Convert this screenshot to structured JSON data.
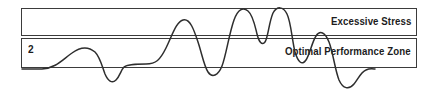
{
  "diagram": {
    "background_color": "#ffffff",
    "border_color": "#3b3b3b",
    "wave_color": "#2e2e2e",
    "text_color": "#1c1c1c"
  },
  "zones": {
    "excessive": {
      "label": "Excessive Stress",
      "top": 8,
      "height": 28
    },
    "optimal": {
      "label": "Optimal Performance Zone",
      "top": 38,
      "height": 30
    }
  },
  "index_marker": {
    "value": "2"
  },
  "chart_data": {
    "type": "line",
    "xlabel": "",
    "ylabel": "",
    "grid": false,
    "legend": null,
    "xlim": [
      21,
      417
    ],
    "ylim": [
      98,
      0
    ],
    "annotations": [
      {
        "text": "Excessive Stress",
        "zone": "excessive",
        "position": "right"
      },
      {
        "text": "Optimal Performance Zone",
        "zone": "optimal",
        "position": "right"
      },
      {
        "text": "2",
        "zone": "optimal",
        "position": "left"
      }
    ],
    "bands": [
      {
        "name": "Excessive Stress",
        "y_top": 8,
        "y_bottom": 36
      },
      {
        "name": "Optimal Performance Zone",
        "y_top": 38,
        "y_bottom": 68
      }
    ],
    "series": [
      {
        "name": "stress-trace",
        "path": "M 22,69 L 42,69 C 56,68 62,60 72,53 C 80,47 88,46 95,52 C 100,57 102,66 105,74 C 108,81 112,84 116,80 C 120,76 121,70 124,67 C 128,64 136,64 146,64 C 156,64 160,60 166,48 C 172,36 176,22 183,20 C 190,18 194,30 198,42 C 202,54 204,66 208,72 C 212,78 218,76 222,66 C 226,56 229,34 234,20 C 238,9 243,7 248,11 C 253,15 255,26 257,34 C 259,42 262,46 265,42 C 268,38 269,22 273,13 C 277,6 283,6 287,14 C 291,22 292,40 295,52 C 298,62 302,66 306,60 C 310,54 312,42 316,36 C 320,30 325,32 329,42 C 333,52 335,70 339,80 C 343,89 349,90 354,84 C 358,79 361,72 366,70 C 370,68 374,69 375,69"
      }
    ]
  }
}
